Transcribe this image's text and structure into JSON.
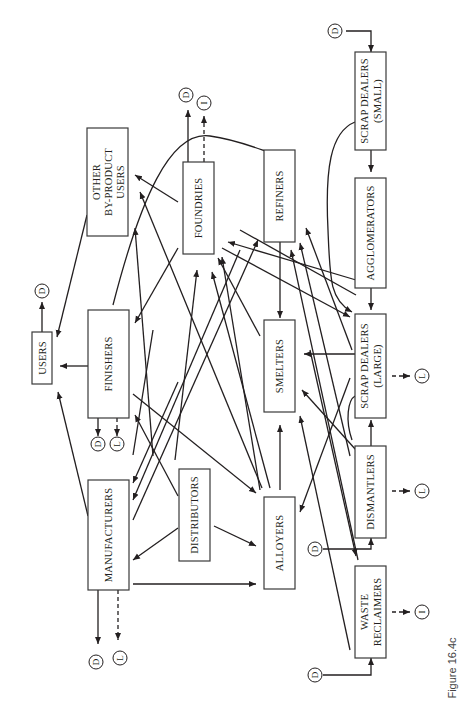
{
  "figure": {
    "caption": "Figure 16.4c",
    "orientation": "rotated-90-ccw"
  },
  "nodes": {
    "users": "USERS",
    "other_line1": "OTHER",
    "other_line2": "BY-PRODUCT",
    "other_line3": "USERS",
    "foundries": "FOUNDRIES",
    "refiners": "REFINERS",
    "scrap_small_line1": "SCRAP DEALERS",
    "scrap_small_line2": "(SMALL)",
    "agglomerators": "AGGLOMERATORS",
    "finishers": "FINISHERS",
    "smelters": "SMELTERS",
    "scrap_large_line1": "SCRAP DEALERS",
    "scrap_large_line2": "(LARGE)",
    "manufacturers": "MANUFACTURERS",
    "distributors": "DISTRIBUTORS",
    "alloyers": "ALLOYERS",
    "dismantlers": "DISMANTLERS",
    "waste_line1": "WASTE",
    "waste_line2": "RECLAIMERS"
  },
  "terminals": {
    "D": "D",
    "I": "I",
    "L": "L"
  },
  "legend_markers": [
    "D",
    "I",
    "L"
  ]
}
